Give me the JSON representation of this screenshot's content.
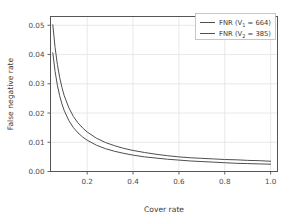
{
  "chart_data": {
    "type": "line",
    "title": "",
    "xlabel": "Cover rate",
    "ylabel": "False negative rate",
    "xlim": [
      0.04,
      1.03
    ],
    "ylim": [
      0.0,
      0.053
    ],
    "grid": true,
    "legend_position": "upper right",
    "xticks": [
      "0.2",
      "0.4",
      "0.6",
      "0.8",
      "1.0"
    ],
    "xtick_values": [
      0.2,
      0.4,
      0.6,
      0.8,
      1.0
    ],
    "yticks": [
      "0.00",
      "0.01",
      "0.02",
      "0.03",
      "0.04",
      "0.05"
    ],
    "ytick_values": [
      0.0,
      0.01,
      0.02,
      0.03,
      0.04,
      0.05
    ],
    "line_color": "#4f4f4f",
    "grid_color": "#e2e2e2",
    "series": [
      {
        "name": "FNR (V1 = 664)",
        "label_prefix": "FNR (V",
        "label_sub": "1",
        "label_suffix": " = 664)",
        "color": "#4f4f4f",
        "x": [
          0.05,
          0.06,
          0.07,
          0.08,
          0.09,
          0.1,
          0.12,
          0.14,
          0.16,
          0.18,
          0.2,
          0.24,
          0.28,
          0.32,
          0.36,
          0.4,
          0.45,
          0.5,
          0.55,
          0.6,
          0.65,
          0.7,
          0.75,
          0.8,
          0.85,
          0.9,
          0.95,
          1.0
        ],
        "y": [
          0.0502,
          0.0424,
          0.0366,
          0.0322,
          0.0287,
          0.0259,
          0.0218,
          0.0188,
          0.0166,
          0.0149,
          0.0135,
          0.0114,
          0.0099,
          0.0088,
          0.0079,
          0.0072,
          0.0065,
          0.0059,
          0.0054,
          0.005,
          0.0047,
          0.0045,
          0.0043,
          0.0041,
          0.004,
          0.0038,
          0.0037,
          0.0035
        ]
      },
      {
        "name": "FNR (V2 = 385)",
        "label_prefix": "FNR (V",
        "label_sub": "2",
        "label_suffix": " = 385)",
        "color": "#4f4f4f",
        "x": [
          0.05,
          0.06,
          0.07,
          0.08,
          0.09,
          0.1,
          0.12,
          0.14,
          0.16,
          0.18,
          0.2,
          0.24,
          0.28,
          0.32,
          0.36,
          0.4,
          0.45,
          0.5,
          0.55,
          0.6,
          0.65,
          0.7,
          0.75,
          0.8,
          0.85,
          0.9,
          0.95,
          1.0
        ],
        "y": [
          0.0406,
          0.0342,
          0.0295,
          0.0259,
          0.0231,
          0.0208,
          0.0174,
          0.015,
          0.0132,
          0.0118,
          0.0107,
          0.009,
          0.0078,
          0.0069,
          0.0062,
          0.0056,
          0.005,
          0.0046,
          0.0042,
          0.0039,
          0.0036,
          0.0034,
          0.0032,
          0.003,
          0.0028,
          0.0027,
          0.0026,
          0.0025
        ]
      }
    ]
  }
}
